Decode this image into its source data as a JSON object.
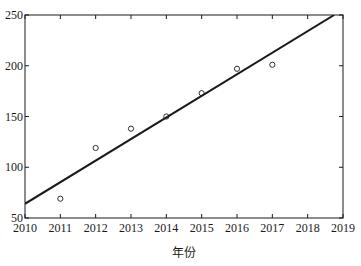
{
  "chart_data": {
    "type": "scatter",
    "title": "",
    "xlabel": "年份",
    "ylabel": "",
    "xlim": [
      2010,
      2019
    ],
    "ylim": [
      50,
      250
    ],
    "x_ticks": [
      2010,
      2011,
      2012,
      2013,
      2014,
      2015,
      2016,
      2017,
      2018,
      2019
    ],
    "y_ticks": [
      50,
      100,
      150,
      200,
      250
    ],
    "grid": false,
    "legend": null,
    "series": [
      {
        "name": "observed",
        "type": "scatter",
        "marker": "open-circle",
        "x": [
          2011,
          2012,
          2013,
          2014,
          2015,
          2016,
          2017
        ],
        "y": [
          69,
          119,
          138,
          150,
          173,
          197,
          201
        ]
      },
      {
        "name": "fit",
        "type": "line",
        "x": [
          2010,
          2018.75
        ],
        "y": [
          64,
          250
        ]
      }
    ]
  },
  "colors": {
    "axis": "#1a1a1a",
    "line": "#1a1a1a",
    "marker": "#1a1a1a",
    "background": "#ffffff"
  }
}
